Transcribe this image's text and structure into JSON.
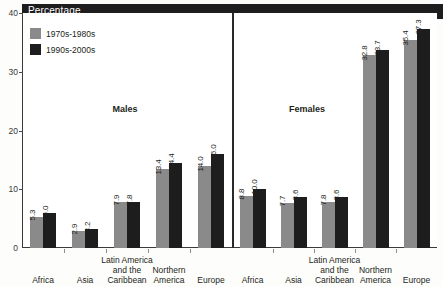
{
  "header": {
    "title": "Percentage"
  },
  "legend": {
    "items": [
      {
        "label": "1970s-1980s",
        "color": "#8a8a8a"
      },
      {
        "label": "1990s-2000s",
        "color": "#1d1d1d"
      }
    ]
  },
  "panels": [
    {
      "title": "Males"
    },
    {
      "title": "Females"
    }
  ],
  "axis": {
    "yticks": [
      "0",
      "10",
      "20",
      "30",
      "40"
    ]
  },
  "chart_data": {
    "type": "bar",
    "title": "Percentage",
    "xlabel": "",
    "ylabel": "Percentage",
    "ylim": [
      0,
      40
    ],
    "yticks": [
      0,
      10,
      20,
      30,
      40
    ],
    "grid": false,
    "legend_position": "top-left",
    "panels": [
      {
        "name": "Males",
        "categories": [
          "Africa",
          "Asia",
          "Latin America and the Caribbean",
          "Northern America",
          "Europe"
        ],
        "category_lines": [
          [
            "Africa"
          ],
          [
            "Asia"
          ],
          [
            "Latin America",
            "and the",
            "Caribbean"
          ],
          [
            "Northern",
            "America"
          ],
          [
            "Europe"
          ]
        ],
        "series": [
          {
            "name": "1970s-1980s",
            "values": [
              5.3,
              2.9,
              7.9,
              13.4,
              14.0
            ]
          },
          {
            "name": "1990s-2000s",
            "values": [
              6.0,
              3.2,
              7.8,
              14.4,
              16.0
            ]
          }
        ]
      },
      {
        "name": "Females",
        "categories": [
          "Africa",
          "Asia",
          "Latin America and the Caribbean",
          "Northern America",
          "Europe"
        ],
        "category_lines": [
          [
            "Africa"
          ],
          [
            "Asia"
          ],
          [
            "Latin America",
            "and the",
            "Caribbean"
          ],
          [
            "Northern",
            "America"
          ],
          [
            "Europe"
          ]
        ],
        "series": [
          {
            "name": "1970s-1980s",
            "values": [
              8.8,
              7.7,
              7.8,
              32.8,
              35.4
            ]
          },
          {
            "name": "1990s-2000s",
            "values": [
              10.0,
              8.6,
              8.6,
              33.7,
              37.3
            ]
          }
        ]
      }
    ],
    "value_labels": {
      "males_1970s_1980s": [
        "5.3",
        "2.9",
        "7.9",
        "13.4",
        "14.0"
      ],
      "males_1990s_2000s": [
        "6.0",
        "3.2",
        "7.8",
        "14.4",
        "16.0"
      ],
      "females_1970s_1980s": [
        "8.8",
        "7.7",
        "7.8",
        "32.8",
        "35.4"
      ],
      "females_1990s_2000s": [
        "10.0",
        "8.6",
        "8.6",
        "33.7",
        "37.3"
      ]
    }
  }
}
